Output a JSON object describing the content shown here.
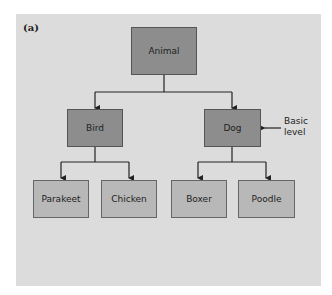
{
  "figure_label": "(a)",
  "nodes": {
    "root": "Animal",
    "level2": [
      "Bird",
      "Dog"
    ],
    "level3": [
      "Parakeet",
      "Chicken",
      "Boxer",
      "Poodle"
    ]
  },
  "annotation": {
    "line1": "Basic",
    "line2": "level"
  },
  "colors": {
    "panel": "#dcdcdc",
    "dark_box": "#8d8d8d",
    "light_box": "#b8b8b8",
    "line": "#222222"
  }
}
